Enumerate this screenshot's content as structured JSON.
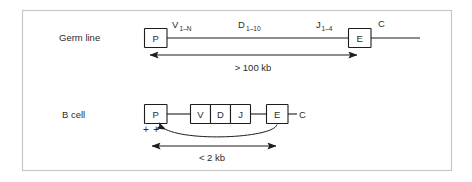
{
  "figure": {
    "frame": {
      "color": "#c8c8c8"
    },
    "ink_color": "#1d1d1d",
    "background": "#ffffff"
  },
  "rows": [
    {
      "id": "germ-line",
      "label": "Germ line",
      "boxes": [
        {
          "id": "promoter",
          "label": "P"
        },
        {
          "id": "enhancer",
          "label": "E"
        }
      ],
      "segments": [
        {
          "id": "v-segment",
          "label": "V",
          "subscript": "1–N"
        },
        {
          "id": "d-segment",
          "label": "D",
          "subscript": "1–10"
        },
        {
          "id": "j-segment",
          "label": "J",
          "subscript": "1–4"
        }
      ],
      "constant_label": "C",
      "distance": {
        "id": "germline-distance",
        "label": "> 100 kb"
      }
    },
    {
      "id": "b-cell",
      "label": "B cell",
      "boxes": [
        {
          "id": "promoter",
          "label": "P"
        },
        {
          "id": "v-box",
          "label": "V"
        },
        {
          "id": "d-box",
          "label": "D"
        },
        {
          "id": "j-box",
          "label": "J"
        },
        {
          "id": "enhancer",
          "label": "E"
        }
      ],
      "constant_label": "C",
      "activation_marks": "+ +",
      "distance": {
        "id": "bcell-distance",
        "label": "< 2 kb"
      }
    }
  ]
}
